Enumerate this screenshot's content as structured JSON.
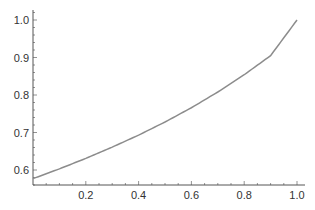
{
  "chart_data": {
    "type": "line",
    "title": "",
    "xlabel": "",
    "ylabel": "",
    "xlim": [
      0,
      1.0
    ],
    "ylim": [
      0.56,
      1.02
    ],
    "grid": false,
    "legend": null,
    "x_ticks": [
      "0.2",
      "0.4",
      "0.6",
      "0.8",
      "1.0"
    ],
    "y_ticks": [
      "0.6",
      "0.7",
      "0.8",
      "0.9",
      "1.0"
    ],
    "series": [
      {
        "name": "curve",
        "color": "#8c8c8c",
        "x": [
          0.0,
          0.1,
          0.2,
          0.3,
          0.4,
          0.5,
          0.6,
          0.7,
          0.8,
          0.9,
          1.0
        ],
        "y": [
          0.577,
          0.603,
          0.631,
          0.661,
          0.693,
          0.728,
          0.766,
          0.808,
          0.854,
          0.905,
          1.0
        ]
      }
    ]
  }
}
